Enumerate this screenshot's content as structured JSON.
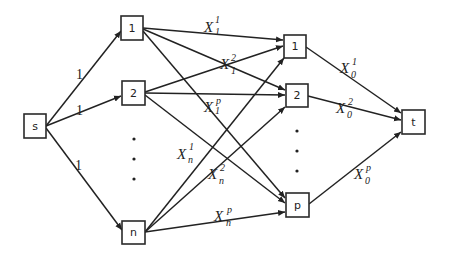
{
  "diagram": {
    "type": "flow-network",
    "nodes": {
      "source": {
        "label": "s"
      },
      "left": [
        {
          "label": "1"
        },
        {
          "label": "2"
        },
        {
          "label": "n"
        }
      ],
      "right": [
        {
          "label": "1"
        },
        {
          "label": "2"
        },
        {
          "label": "p"
        }
      ],
      "sink": {
        "label": "t"
      }
    },
    "source_edges": [
      {
        "label": "1"
      },
      {
        "label": "1"
      },
      {
        "label": "1"
      }
    ],
    "middle_edge_labels": [
      {
        "base": "X",
        "sup": "1",
        "sub": "1"
      },
      {
        "base": "X",
        "sup": "2",
        "sub": "1"
      },
      {
        "base": "X",
        "sup": "p",
        "sub": "1"
      },
      {
        "base": "X",
        "sup": "1",
        "sub": "n"
      },
      {
        "base": "X",
        "sup": "2",
        "sub": "n"
      },
      {
        "base": "X",
        "sup": "p",
        "sub": "n"
      }
    ],
    "sink_edge_labels": [
      {
        "base": "X",
        "sup": "1",
        "sub": "0"
      },
      {
        "base": "X",
        "sup": "2",
        "sub": "0"
      },
      {
        "base": "X",
        "sup": "p",
        "sub": "0"
      }
    ],
    "ellipsis": {
      "left": "⋮",
      "right": "⋮"
    },
    "colors": {
      "line": "#222222",
      "background": "#ffffff"
    }
  }
}
